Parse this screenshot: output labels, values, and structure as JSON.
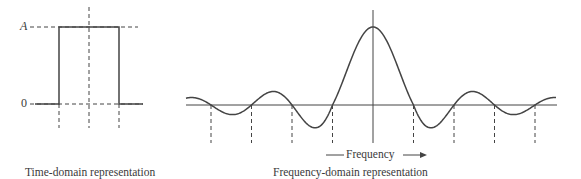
{
  "chart_data": [
    {
      "type": "line",
      "title": "Time-domain representation",
      "description": "Rectangular pulse of amplitude A",
      "y_tick_labels": [
        "A",
        "0"
      ],
      "pulse": {
        "amplitude": "A",
        "baseline": "0"
      },
      "points_px": [
        [
          35,
          104
        ],
        [
          59,
          104
        ],
        [
          59,
          27
        ],
        [
          119,
          27
        ],
        [
          119,
          104
        ],
        [
          143,
          104
        ]
      ]
    },
    {
      "type": "line",
      "title": "Frequency-domain representation",
      "description": "Sinc function spectrum of rectangular pulse",
      "xlabel": "Frequency",
      "function": "sinc",
      "zero_crossings_count_each_side": 4
    }
  ],
  "labels": {
    "amplitude": "A",
    "zero": "0",
    "time_caption": "Time-domain representation",
    "freq_caption": "Frequency-domain representation",
    "freq_axis": "Frequency"
  }
}
